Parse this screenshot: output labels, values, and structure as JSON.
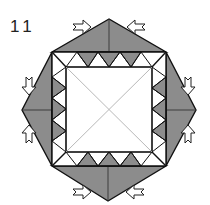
{
  "diagram": {
    "step_number": "11",
    "colors": {
      "fill_grey": "#8c8c8c",
      "line": "#111111",
      "diagonal": "#b0b0b0",
      "background": "#ffffff"
    },
    "flaps": [
      {
        "side": "top",
        "arrows": [
          "push-right",
          "push-left"
        ]
      },
      {
        "side": "right",
        "arrows": [
          "push-down",
          "push-up"
        ]
      },
      {
        "side": "bottom",
        "arrows": [
          "push-right",
          "push-left"
        ]
      },
      {
        "side": "left",
        "arrows": [
          "push-down",
          "push-up"
        ]
      }
    ]
  }
}
